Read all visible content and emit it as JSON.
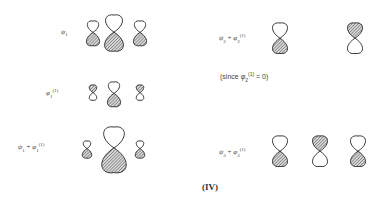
{
  "rows": {
    "psi1": {
      "label_sym": "ψ",
      "label_sub": "1",
      "label": "ψ1"
    },
    "phi1": {
      "label_sym": "φ",
      "label_sub": "1",
      "label_sup": "(1)",
      "label": "φ1(1)"
    },
    "sum1": {
      "label_a": "ψ",
      "sub_a": "1",
      "plus": "+",
      "label_b": "φ",
      "sub_b": "1",
      "sup_b": "(1)",
      "label": "ψ1 + φ1(1)"
    },
    "sum2": {
      "label_a": "ψ",
      "sub_a": "2",
      "plus": "+",
      "label_b": "φ",
      "sub_b": "2",
      "sup_b": "(1)",
      "label": "ψ2 + φ2(1)"
    },
    "note2": {
      "text": "(since φ2(1) = 0)",
      "pre": "(since ",
      "sym": "φ",
      "sub": "2",
      "sup": "(1)",
      "post": " = 0)"
    },
    "sum3": {
      "label_a": "ψ",
      "sub_a": "3",
      "plus": "+",
      "label_b": "φ",
      "sub_b": "3",
      "sup_b": "(1)",
      "label": "ψ3 + φ3(1)"
    }
  },
  "caption": "(IV)",
  "colors": {
    "stroke": "#3a3a3a",
    "hatch": "#555555",
    "background": "#ffffff"
  },
  "orbitals": [
    {
      "row": "psi1",
      "cx": 93,
      "cy": 32,
      "top_r": 6,
      "bot_r": 7,
      "shaded": "bottom"
    },
    {
      "row": "psi1",
      "cx": 114,
      "cy": 32,
      "top_r": 9,
      "bot_r": 10,
      "shaded": "bottom"
    },
    {
      "row": "psi1",
      "cx": 140,
      "cy": 32,
      "top_r": 6,
      "bot_r": 7,
      "shaded": "bottom"
    },
    {
      "row": "phi1",
      "cx": 93,
      "cy": 93,
      "top_r": 4,
      "bot_r": 4,
      "shaded": "top"
    },
    {
      "row": "phi1",
      "cx": 114,
      "cy": 93,
      "top_r": 6,
      "bot_r": 7,
      "shaded": "bottom"
    },
    {
      "row": "phi1",
      "cx": 140,
      "cy": 93,
      "top_r": 4,
      "bot_r": 4,
      "shaded": "top"
    },
    {
      "row": "sum1",
      "cx": 87,
      "cy": 149,
      "top_r": 4,
      "bot_r": 5,
      "shaded": "bottom"
    },
    {
      "row": "sum1",
      "cx": 114,
      "cy": 148,
      "top_r": 11,
      "bot_r": 13,
      "shaded": "bottom"
    },
    {
      "row": "sum1",
      "cx": 140,
      "cy": 149,
      "top_r": 4,
      "bot_r": 5,
      "shaded": "bottom"
    },
    {
      "row": "sum2",
      "cx": 280,
      "cy": 38,
      "top_r": 8,
      "bot_r": 8,
      "shaded": "bottom"
    },
    {
      "row": "sum2",
      "cx": 355,
      "cy": 38,
      "top_r": 8,
      "bot_r": 8,
      "shaded": "top"
    },
    {
      "row": "sum3",
      "cx": 280,
      "cy": 151,
      "top_r": 8,
      "bot_r": 8,
      "shaded": "bottom"
    },
    {
      "row": "sum3",
      "cx": 320,
      "cy": 151,
      "top_r": 8,
      "bot_r": 8,
      "shaded": "top"
    },
    {
      "row": "sum3",
      "cx": 358,
      "cy": 151,
      "top_r": 8,
      "bot_r": 8,
      "shaded": "bottom"
    }
  ]
}
